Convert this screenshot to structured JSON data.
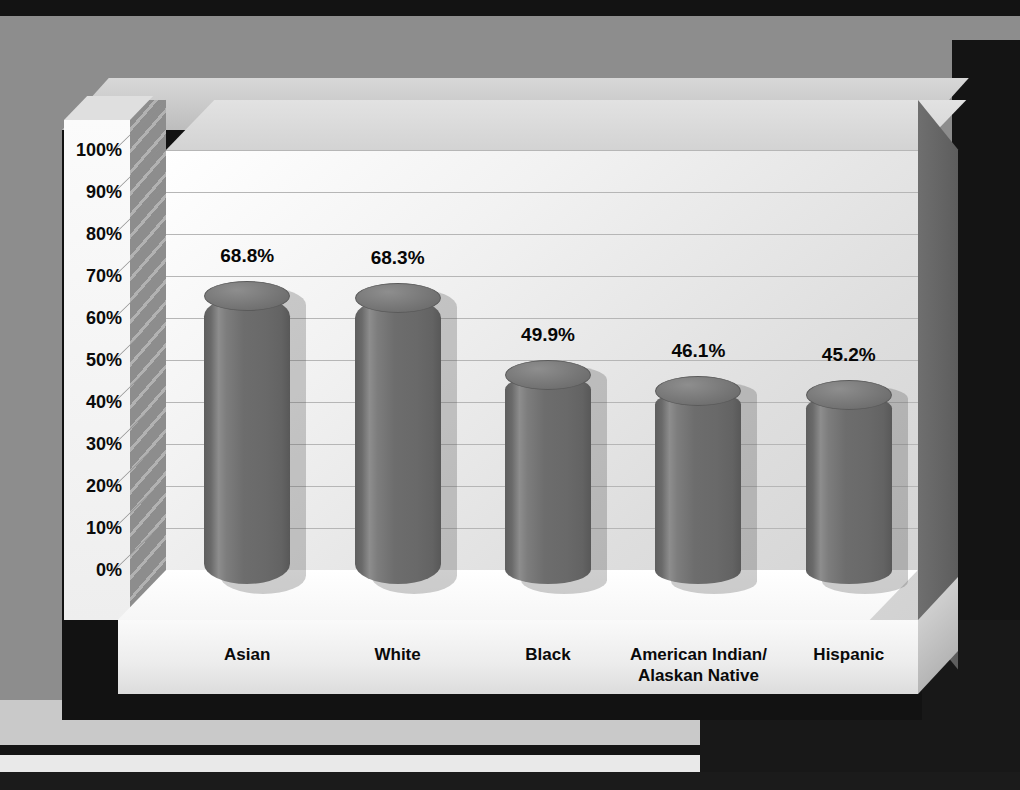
{
  "chart_data": {
    "type": "bar",
    "title": "",
    "xlabel": "Race/Ethnicity",
    "ylabel": "Percentage",
    "categories": [
      "Asian",
      "White",
      "Black",
      "American Indian/\nAlaskan Native",
      "Hispanic"
    ],
    "values": [
      68.8,
      68.3,
      49.9,
      46.1,
      45.2
    ],
    "data_labels": [
      "68.8%",
      "68.3%",
      "49.9%",
      "46.1%",
      "45.2%"
    ],
    "ytick_labels": [
      "100%",
      "90%",
      "80%",
      "70%",
      "60%",
      "50%",
      "40%",
      "30%",
      "20%",
      "10%",
      "0%"
    ],
    "ytick_values": [
      100,
      90,
      80,
      70,
      60,
      50,
      40,
      30,
      20,
      10,
      0
    ],
    "ylim": [
      0,
      100
    ],
    "grid": true,
    "legend": false,
    "style": "3d-cylinder",
    "bar_color": "#6d6d6d",
    "bar_highlight_color": "#8d8d8d",
    "plot_background": "#eeeeee",
    "frame_color": "#121212",
    "page_background": "#8d8d8d",
    "axis_title_color": "#ffffff",
    "tick_label_color": "#0b0b0b"
  }
}
